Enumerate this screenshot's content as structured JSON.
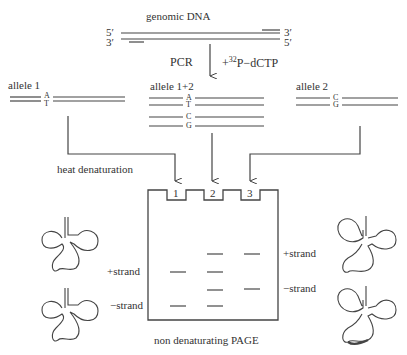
{
  "genomic": {
    "title": "genomic DNA",
    "top_left": "5′",
    "top_right": "3′",
    "bottom_left": "3′",
    "bottom_right": "5′"
  },
  "pcr": {
    "label": "PCR",
    "reagent_prefix": "+",
    "reagent_sup": "32",
    "reagent": "P−dCTP"
  },
  "allele1": {
    "label": "allele 1",
    "top_base": "A",
    "bottom_base": "T"
  },
  "allele12": {
    "label": "allele 1+2",
    "bases": [
      "A",
      "T",
      "C",
      "G"
    ]
  },
  "allele2": {
    "label": "allele 2",
    "top_base": "C",
    "bottom_base": "G"
  },
  "process": {
    "heat": "heat denaturation"
  },
  "gel": {
    "title": "non denaturating PAGE",
    "lanes": [
      "1",
      "2",
      "3"
    ],
    "left_labels": {
      "plus": "+strand",
      "minus": "−strand"
    },
    "right_labels": {
      "plus": "+strand",
      "minus": "−strand"
    },
    "bands": {
      "lane1": [
        "+strand (allele 1)",
        "−strand (allele 1)"
      ],
      "lane2": [
        "+strand (allele 2)",
        "+strand (allele 1)",
        "−strand (allele 2)",
        "−strand (allele 1)"
      ],
      "lane3": [
        "+strand (allele 2)",
        "−strand (allele 2)"
      ]
    }
  },
  "colors": {
    "line": "#444444",
    "text": "#333333",
    "band": "#555555"
  }
}
